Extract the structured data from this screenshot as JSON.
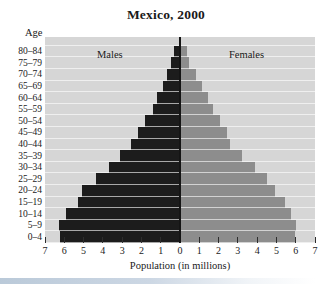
{
  "chart_data": {
    "type": "bar",
    "variant": "population-pyramid",
    "title": "Mexico, 2000",
    "y_axis_label": "Age",
    "x_axis_label": "Population (in millions)",
    "left_series_label": "Males",
    "right_series_label": "Females",
    "age_groups": [
      "80–84",
      "75–79",
      "70–74",
      "65–69",
      "60–64",
      "55–59",
      "50–54",
      "45–49",
      "40–44",
      "35–39",
      "30–34",
      "25–29",
      "20–24",
      "15–19",
      "10–14",
      "5–9",
      "0–4"
    ],
    "series": [
      {
        "name": "Males",
        "side": "left",
        "values": [
          0.3,
          0.45,
          0.7,
          0.9,
          1.2,
          1.4,
          1.8,
          2.2,
          2.55,
          3.1,
          3.7,
          4.35,
          5.1,
          5.3,
          5.9,
          6.3,
          6.2
        ]
      },
      {
        "name": "Females",
        "side": "right",
        "values": [
          0.3,
          0.45,
          0.8,
          1.1,
          1.4,
          1.65,
          2.05,
          2.4,
          2.55,
          3.2,
          3.85,
          4.45,
          4.9,
          5.4,
          5.7,
          6.0,
          5.9
        ]
      }
    ],
    "x_tick_labels": [
      "7",
      "6",
      "5",
      "4",
      "3",
      "2",
      "1",
      "0",
      "1",
      "2",
      "3",
      "4",
      "5",
      "6",
      "7"
    ],
    "xlim_each_side": [
      0,
      7
    ],
    "grid": true,
    "legend_position": "inside-top",
    "colors": {
      "males_bar": "#1c1c1c",
      "females_bar": "#8d8d8d",
      "plot_background": "#d6d6d6",
      "gridline": "#f0f0f0",
      "center_line": "#141414",
      "page_background": "#ffffff",
      "bottom_strip": "#b9c7d7"
    }
  }
}
